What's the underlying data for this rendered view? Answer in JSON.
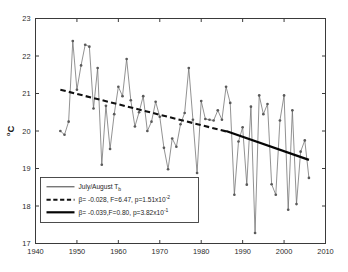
{
  "chart_data": {
    "type": "line",
    "title": "",
    "xlabel": "",
    "ylabel": "°C",
    "xlim": [
      1940,
      2010
    ],
    "ylim": [
      17,
      23
    ],
    "xticks": [
      1940,
      1950,
      1960,
      1970,
      1980,
      1990,
      2000,
      2010
    ],
    "yticks": [
      17,
      18,
      19,
      20,
      21,
      22,
      23
    ],
    "grid": false,
    "legend_position": "lower left",
    "series": [
      {
        "name": "July/August T_b",
        "style": "line-with-markers",
        "color": "#6e6e6e",
        "x": [
          1946,
          1947,
          1948,
          1949,
          1950,
          1951,
          1952,
          1953,
          1954,
          1955,
          1956,
          1957,
          1958,
          1959,
          1960,
          1961,
          1962,
          1963,
          1964,
          1965,
          1966,
          1967,
          1968,
          1969,
          1970,
          1971,
          1972,
          1973,
          1974,
          1975,
          1976,
          1977,
          1978,
          1979,
          1980,
          1981,
          1982,
          1983,
          1984,
          1985,
          1986,
          1987,
          1988,
          1989,
          1990,
          1991,
          1992,
          1993,
          1994,
          1995,
          1996,
          1997,
          1998,
          1999,
          2000,
          2001,
          2002,
          2003,
          2004,
          2005,
          2006
        ],
        "y": [
          20.0,
          19.9,
          20.25,
          22.4,
          21.1,
          21.75,
          22.3,
          22.25,
          20.6,
          21.68,
          19.1,
          20.67,
          19.52,
          20.45,
          21.18,
          20.93,
          21.92,
          20.82,
          20.12,
          20.5,
          20.93,
          20.0,
          20.25,
          20.78,
          20.38,
          19.55,
          18.98,
          19.8,
          19.58,
          20.18,
          20.48,
          21.68,
          20.3,
          18.88,
          20.8,
          20.32,
          20.3,
          20.28,
          20.55,
          20.3,
          21.18,
          20.75,
          18.3,
          19.72,
          20.1,
          18.57,
          20.65,
          17.28,
          20.95,
          20.45,
          20.72,
          18.58,
          18.3,
          20.28,
          20.95,
          17.9,
          20.55,
          18.05,
          19.45,
          19.75,
          18.75
        ]
      },
      {
        "name": "trend-dashed",
        "style": "dashed-trend",
        "color": "#111111",
        "x": [
          1946,
          1986
        ],
        "y": [
          21.1,
          19.99
        ]
      },
      {
        "name": "trend-solid",
        "style": "solid-trend",
        "color": "#050505",
        "x": [
          1986,
          2006
        ],
        "y": [
          20.0,
          19.23
        ]
      }
    ]
  },
  "axes": {
    "ylabel": "°C",
    "ylabel_degree": "o",
    "ylabel_c": "C",
    "xtick_labels": [
      "1940",
      "1950",
      "1960",
      "1970",
      "1980",
      "1990",
      "2000",
      "2010"
    ],
    "ytick_labels": [
      "17",
      "18",
      "19",
      "20",
      "21",
      "22",
      "23"
    ]
  },
  "legend": {
    "entries": [
      {
        "sample": "thin-line",
        "text_main": "July/August T",
        "text_sub": "b",
        "text_sup": "",
        "text_tail": ""
      },
      {
        "sample": "dashed-line",
        "text_main": "β= -0.028, F=6.47, p=1.51x10",
        "text_sub": "",
        "text_sup": "-2",
        "text_tail": ""
      },
      {
        "sample": "solid-line",
        "text_main": "β= -0.039,F=0.80, p=3.82x10",
        "text_sub": "",
        "text_sup": "-1",
        "text_tail": ""
      }
    ]
  }
}
